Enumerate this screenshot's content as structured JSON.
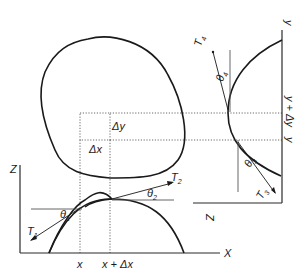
{
  "figure": {
    "colors": {
      "ink": "#1a1a1a",
      "reference_line": "#555555",
      "background": "#ffffff"
    }
  },
  "element": {
    "dx_label": "Δx",
    "dy_label": "Δy"
  },
  "xz_plot": {
    "z_axis_label": "Z",
    "x_axis_label": "X",
    "tick_labels": {
      "x": "x",
      "x_plus_dx": "x + Δx"
    },
    "tensions": [
      {
        "name": "T",
        "sub": "1",
        "angle": "θ",
        "angle_sub": "1"
      },
      {
        "name": "T",
        "sub": "2",
        "angle": "θ",
        "angle_sub": "2"
      }
    ]
  },
  "yz_plot": {
    "y_axis_label": "y",
    "z_axis_label": "Z",
    "tick_labels": {
      "y": "y",
      "y_plus_dy": "y + Δy"
    },
    "tensions": [
      {
        "name": "T",
        "sub": "3",
        "angle": "θ",
        "angle_sub": "3"
      },
      {
        "name": "T",
        "sub": "4",
        "angle": "θ",
        "angle_sub": "4"
      }
    ]
  }
}
